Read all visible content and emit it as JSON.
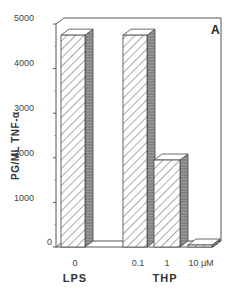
{
  "chart_data": {
    "type": "bar",
    "style": "3d-hatched",
    "title": "",
    "panel_label": "A",
    "ylabel": "PG/ML  TNF-α",
    "xlabel_groups": [
      {
        "label": "LPS",
        "categories": [
          "0"
        ]
      },
      {
        "label": "THP",
        "categories": [
          "0.1",
          "1",
          "10 μM"
        ]
      }
    ],
    "categories": [
      "0",
      "0.1",
      "1",
      "10 μM"
    ],
    "values": [
      4750,
      4750,
      1950,
      30
    ],
    "ylim": [
      0,
      5000
    ],
    "yticks": [
      0,
      1000,
      2000,
      3000,
      4000,
      5000
    ],
    "ytick_labels": [
      "0",
      "1000",
      "2000",
      "3000",
      "4000",
      "5000"
    ],
    "grid": false,
    "legend": null
  },
  "labels": {
    "panel": "A",
    "ylabel": "PG/ML  TNF-α",
    "group_lps": "LPS",
    "group_thp": "THP",
    "x0": "0",
    "x1": "0.1",
    "x2": "1",
    "x3": "10 μM",
    "y0": "0",
    "y1": "1000",
    "y2": "2000",
    "y3": "3000",
    "y4": "4000",
    "y5": "5000"
  }
}
